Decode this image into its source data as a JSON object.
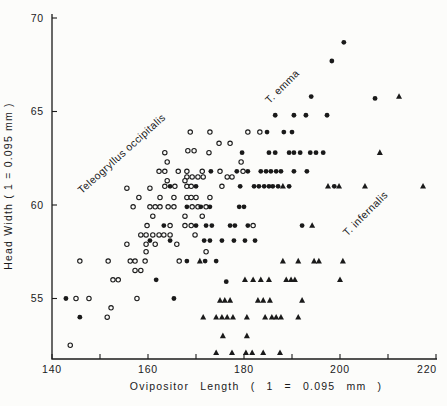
{
  "figure": {
    "background": "#fcfcfa",
    "ink": "#1a1a1a"
  },
  "chart_data": {
    "type": "scatter",
    "title": "",
    "xlabel": "Ovipositor Length ( 1 = 0.095 mm )",
    "ylabel": "Head Width ( 1 = 0.095 mm )",
    "x_axis": {
      "min": 140,
      "max": 220,
      "tick_step": 10,
      "labeled_ticks": [
        140,
        160,
        180,
        200,
        220
      ]
    },
    "y_axis": {
      "min": 51.8,
      "max": 70,
      "labeled_ticks": [
        55,
        60,
        65,
        70
      ]
    },
    "grid": false,
    "legend_position": "in-plot rotated annotations",
    "annotations": [
      {
        "id": "occipitalis-label",
        "text": "Teleogryllus occipitalis",
        "x": 155.0,
        "y": 62.6,
        "rotation": -42
      },
      {
        "id": "emma-label",
        "text": "T. emma",
        "x": 188.5,
        "y": 66.2,
        "rotation": -45
      },
      {
        "id": "infernalis-label",
        "text": "T. infernalis",
        "x": 205.8,
        "y": 59.4,
        "rotation": -45
      }
    ],
    "series": [
      {
        "name": "Teleogryllus occipitalis",
        "marker": "open-circle",
        "points": [
          [
            168.8,
            63.9
          ],
          [
            172.9,
            63.9
          ],
          [
            180.8,
            63.9
          ],
          [
            183.3,
            63.9
          ],
          [
            174.8,
            63.3
          ],
          [
            177.1,
            63.3
          ],
          [
            163.5,
            62.8
          ],
          [
            168.3,
            62.9
          ],
          [
            169.6,
            62.9
          ],
          [
            172.7,
            62.8
          ],
          [
            164.0,
            62.3
          ],
          [
            179.4,
            62.3
          ],
          [
            162.3,
            61.8
          ],
          [
            163.5,
            61.8
          ],
          [
            166.3,
            61.8
          ],
          [
            168.1,
            61.8
          ],
          [
            171.3,
            61.8
          ],
          [
            175.0,
            61.8
          ],
          [
            179.8,
            61.8
          ],
          [
            168.1,
            61.5
          ],
          [
            169.2,
            61.5
          ],
          [
            170.4,
            61.5
          ],
          [
            171.5,
            61.5
          ],
          [
            176.5,
            61.5
          ],
          [
            177.5,
            61.5
          ],
          [
            164.0,
            61.3
          ],
          [
            167.7,
            61.3
          ],
          [
            163.5,
            61.0
          ],
          [
            165.6,
            61.0
          ],
          [
            168.1,
            61.0
          ],
          [
            169.0,
            61.0
          ],
          [
            175.4,
            61.0
          ],
          [
            155.6,
            60.9
          ],
          [
            160.4,
            60.9
          ],
          [
            158.1,
            60.4
          ],
          [
            162.5,
            60.4
          ],
          [
            165.4,
            60.4
          ],
          [
            168.1,
            60.4
          ],
          [
            169.0,
            60.4
          ],
          [
            170.0,
            60.4
          ],
          [
            172.9,
            60.4
          ],
          [
            156.9,
            59.9
          ],
          [
            160.4,
            59.9
          ],
          [
            161.5,
            59.9
          ],
          [
            162.5,
            59.9
          ],
          [
            164.2,
            59.9
          ],
          [
            165.4,
            59.9
          ],
          [
            169.2,
            59.9
          ],
          [
            170.4,
            59.9
          ],
          [
            172.1,
            59.9
          ],
          [
            161.0,
            59.4
          ],
          [
            167.7,
            59.4
          ],
          [
            171.3,
            59.4
          ],
          [
            159.8,
            58.9
          ],
          [
            164.6,
            58.9
          ],
          [
            167.7,
            58.9
          ],
          [
            169.0,
            58.9
          ],
          [
            181.9,
            58.9
          ],
          [
            158.5,
            58.4
          ],
          [
            159.6,
            58.4
          ],
          [
            161.0,
            58.4
          ],
          [
            162.3,
            58.4
          ],
          [
            163.3,
            58.4
          ],
          [
            164.6,
            58.4
          ],
          [
            169.8,
            58.4
          ],
          [
            155.6,
            57.9
          ],
          [
            159.6,
            57.9
          ],
          [
            161.5,
            57.9
          ],
          [
            166.0,
            57.9
          ],
          [
            159.6,
            57.5
          ],
          [
            172.1,
            57.5
          ],
          [
            145.8,
            57.0
          ],
          [
            151.7,
            57.0
          ],
          [
            156.3,
            57.0
          ],
          [
            157.3,
            57.0
          ],
          [
            159.4,
            57.0
          ],
          [
            166.5,
            57.0
          ],
          [
            157.3,
            56.5
          ],
          [
            158.5,
            56.5
          ],
          [
            152.7,
            56.0
          ],
          [
            153.8,
            56.0
          ],
          [
            145.0,
            55.0
          ],
          [
            147.7,
            55.0
          ],
          [
            157.7,
            55.0
          ],
          [
            152.3,
            54.5
          ],
          [
            151.5,
            54.0
          ],
          [
            143.8,
            52.5
          ]
        ]
      },
      {
        "name": "T. emma",
        "marker": "filled-circle",
        "points": [
          [
            200.8,
            68.7
          ],
          [
            198.3,
            67.7
          ],
          [
            194.0,
            65.8
          ],
          [
            207.3,
            65.7
          ],
          [
            186.5,
            64.8
          ],
          [
            190.4,
            64.8
          ],
          [
            192.9,
            64.8
          ],
          [
            197.3,
            64.8
          ],
          [
            184.8,
            63.9
          ],
          [
            188.3,
            63.9
          ],
          [
            190.0,
            63.9
          ],
          [
            179.6,
            62.8
          ],
          [
            185.2,
            62.8
          ],
          [
            186.5,
            62.8
          ],
          [
            189.4,
            62.8
          ],
          [
            190.4,
            62.8
          ],
          [
            191.7,
            62.8
          ],
          [
            193.8,
            62.8
          ],
          [
            195.0,
            62.8
          ],
          [
            196.5,
            62.8
          ],
          [
            173.1,
            61.8
          ],
          [
            178.5,
            61.8
          ],
          [
            180.8,
            61.8
          ],
          [
            183.5,
            61.8
          ],
          [
            184.6,
            61.8
          ],
          [
            185.6,
            61.8
          ],
          [
            186.7,
            61.8
          ],
          [
            187.7,
            61.8
          ],
          [
            190.4,
            61.8
          ],
          [
            193.1,
            61.8
          ],
          [
            164.6,
            61.0
          ],
          [
            170.0,
            61.0
          ],
          [
            179.2,
            61.0
          ],
          [
            182.1,
            61.0
          ],
          [
            183.1,
            61.0
          ],
          [
            184.2,
            61.0
          ],
          [
            185.2,
            61.0
          ],
          [
            186.0,
            61.0
          ],
          [
            187.1,
            61.0
          ],
          [
            189.4,
            61.0
          ],
          [
            198.8,
            61.0
          ],
          [
            168.1,
            59.9
          ],
          [
            171.0,
            59.9
          ],
          [
            172.9,
            59.9
          ],
          [
            179.0,
            59.9
          ],
          [
            180.0,
            59.9
          ],
          [
            163.3,
            58.9
          ],
          [
            170.0,
            58.9
          ],
          [
            172.1,
            58.9
          ],
          [
            173.3,
            58.9
          ],
          [
            177.1,
            58.9
          ],
          [
            178.1,
            58.9
          ],
          [
            180.8,
            58.9
          ],
          [
            192.1,
            58.9
          ],
          [
            160.4,
            58.1
          ],
          [
            164.6,
            58.1
          ],
          [
            171.7,
            58.1
          ],
          [
            172.9,
            58.1
          ],
          [
            175.4,
            58.1
          ],
          [
            177.9,
            58.1
          ],
          [
            180.2,
            58.1
          ],
          [
            182.3,
            58.1
          ],
          [
            168.1,
            57.0
          ],
          [
            171.9,
            57.0
          ],
          [
            174.2,
            57.0
          ],
          [
            161.7,
            56.0
          ],
          [
            176.3,
            55.9
          ],
          [
            142.9,
            55.0
          ],
          [
            165.4,
            55.0
          ],
          [
            145.8,
            54.0
          ]
        ]
      },
      {
        "name": "T. infernalis",
        "marker": "filled-triangle",
        "points": [
          [
            212.3,
            65.8
          ],
          [
            208.3,
            62.8
          ],
          [
            188.1,
            61.0
          ],
          [
            197.5,
            61.0
          ],
          [
            199.8,
            61.0
          ],
          [
            205.2,
            61.0
          ],
          [
            217.3,
            61.0
          ],
          [
            194.2,
            58.9
          ],
          [
            170.8,
            57.0
          ],
          [
            188.1,
            57.0
          ],
          [
            191.3,
            57.0
          ],
          [
            194.6,
            57.0
          ],
          [
            195.6,
            57.0
          ],
          [
            200.6,
            57.0
          ],
          [
            180.2,
            56.0
          ],
          [
            181.9,
            56.0
          ],
          [
            183.5,
            56.0
          ],
          [
            185.2,
            56.0
          ],
          [
            188.8,
            56.0
          ],
          [
            189.8,
            56.0
          ],
          [
            190.6,
            56.0
          ],
          [
            200.0,
            56.0
          ],
          [
            175.0,
            54.9
          ],
          [
            176.0,
            54.9
          ],
          [
            177.1,
            54.9
          ],
          [
            182.9,
            54.9
          ],
          [
            184.0,
            54.9
          ],
          [
            185.4,
            54.9
          ],
          [
            192.1,
            54.9
          ],
          [
            171.5,
            54.0
          ],
          [
            174.2,
            54.0
          ],
          [
            175.4,
            54.0
          ],
          [
            176.5,
            54.0
          ],
          [
            177.7,
            54.0
          ],
          [
            180.6,
            54.0
          ],
          [
            184.4,
            54.0
          ],
          [
            185.8,
            54.0
          ],
          [
            186.7,
            54.0
          ],
          [
            187.7,
            54.0
          ],
          [
            191.3,
            54.0
          ],
          [
            175.6,
            53.0
          ],
          [
            180.6,
            53.0
          ],
          [
            174.2,
            52.1
          ],
          [
            177.5,
            52.1
          ],
          [
            180.4,
            52.1
          ],
          [
            181.7,
            52.1
          ],
          [
            184.0,
            52.1
          ],
          [
            187.5,
            52.1
          ]
        ]
      }
    ]
  }
}
